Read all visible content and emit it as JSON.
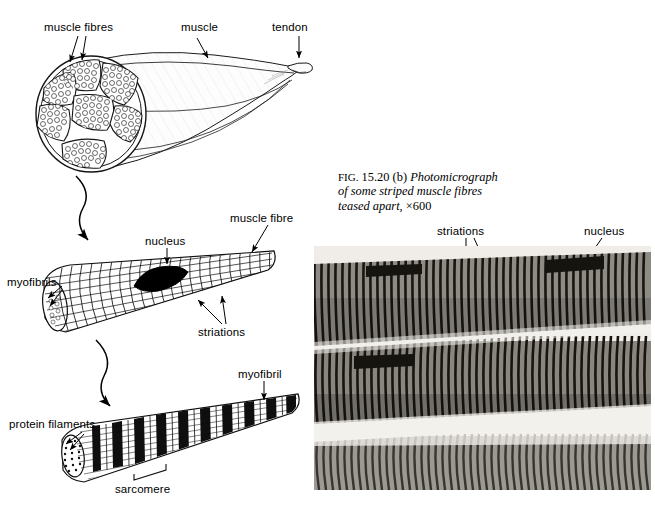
{
  "figure": {
    "caption_prefix": "FIG.",
    "caption_number": "15.20",
    "caption_part": "(b)",
    "caption_line1_italic": "Photomicrograph",
    "caption_line2_italic": "of some striped muscle fibres",
    "caption_line3_italic": "teased apart,",
    "caption_magnification": "×600"
  },
  "diagram_whole_muscle": {
    "label_muscle_fibres": "muscle fibres",
    "label_muscle": "muscle",
    "label_tendon": "tendon"
  },
  "diagram_muscle_fibre": {
    "label_nucleus": "nucleus",
    "label_muscle_fibre": "muscle fibre",
    "label_myofibrils": "myofibrils",
    "label_striations": "striations"
  },
  "diagram_myofibril": {
    "label_myofibril": "myofibril",
    "label_protein_filaments": "protein filaments",
    "label_sarcomere": "sarcomere"
  },
  "photomicrograph": {
    "label_striations": "striations",
    "label_nucleus": "nucleus"
  },
  "colors": {
    "ink": "#000000",
    "background": "#ffffff",
    "photo_light": "#efece7",
    "photo_dark": "#1d1b18",
    "photo_mid": "#6e6a64"
  }
}
